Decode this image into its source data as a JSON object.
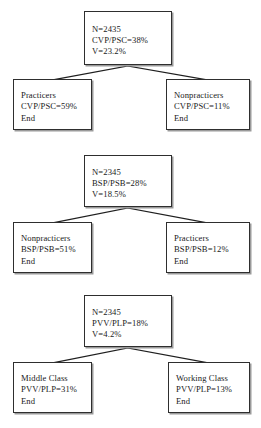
{
  "diagram": {
    "type": "decision-tree",
    "sections": [
      {
        "id": "section-1",
        "root": {
          "name": "root-node-1",
          "lines": [
            "N=2435",
            "CVP/PSC=38%",
            "V=23.2%"
          ],
          "n": "2435",
          "measure": "CVP/PSC",
          "measure_value": "38%",
          "variance_label": "V",
          "variance_value": "23.2%"
        },
        "children": [
          {
            "name": "leaf-node-practicers-1",
            "lines": [
              "Practicers",
              "CVP/PSC=59%",
              "End"
            ],
            "label": "Practicers",
            "measure": "CVP/PSC",
            "measure_value": "59%",
            "terminal": "End"
          },
          {
            "name": "leaf-node-nonpracticers-1",
            "lines": [
              "Nonpracticers",
              "CVP/PSC=11%",
              "End"
            ],
            "label": "Nonpracticers",
            "measure": "CVP/PSC",
            "measure_value": "11%",
            "terminal": "End"
          }
        ]
      },
      {
        "id": "section-2",
        "root": {
          "name": "root-node-2",
          "lines": [
            "N=2345",
            "BSP/PSB=28%",
            "V=18.5%"
          ],
          "n": "2345",
          "measure": "BSP/PSB",
          "measure_value": "28%",
          "variance_label": "V",
          "variance_value": "18.5%"
        },
        "children": [
          {
            "name": "leaf-node-nonpracticers-2",
            "lines": [
              "Nonpracticers",
              "BSP/PSB=51%",
              "End"
            ],
            "label": "Nonpracticers",
            "measure": "BSP/PSB",
            "measure_value": "51%",
            "terminal": "End"
          },
          {
            "name": "leaf-node-practicers-2",
            "lines": [
              "Practicers",
              "BSP/PSB=12%",
              "End"
            ],
            "label": "Practicers",
            "measure": "BSP/PSB",
            "measure_value": "12%",
            "terminal": "End"
          }
        ]
      },
      {
        "id": "section-3",
        "root": {
          "name": "root-node-3",
          "lines": [
            "N=2345",
            "PVV/PLP=18%",
            "V=4.2%"
          ],
          "n": "2345",
          "measure": "PVV/PLP",
          "measure_value": "18%",
          "variance_label": "V",
          "variance_value": "4.2%"
        },
        "children": [
          {
            "name": "leaf-node-middle-class",
            "lines": [
              "Middle Class",
              "PVV/PLP=31%",
              "End"
            ],
            "label": "Middle Class",
            "measure": "PVV/PLP",
            "measure_value": "31%",
            "terminal": "End"
          },
          {
            "name": "leaf-node-working-class",
            "lines": [
              "Working Class",
              "PVV/PLP=13%",
              "End"
            ],
            "label": "Working Class",
            "measure": "PVV/PLP",
            "measure_value": "13%",
            "terminal": "End"
          }
        ]
      }
    ],
    "colors": {
      "background": "#ffffff",
      "box_border": "#2e2e2e",
      "box_fill": "#ffffff",
      "box_shadow": "#9a9a9a",
      "connector": "#1f1f1f",
      "text": "#1a1a1a"
    }
  }
}
